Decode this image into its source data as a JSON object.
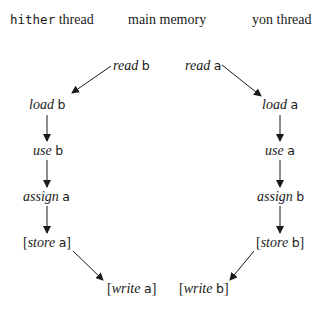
{
  "headers": {
    "hither": {
      "mono": "hither",
      "rest": " thread"
    },
    "main": "main memory",
    "yon": "yon thread"
  },
  "nodes": {
    "read_b": {
      "verb": "read",
      "var": "b",
      "open": "",
      "close": ""
    },
    "read_a": {
      "verb": "read",
      "var": "a",
      "open": "",
      "close": ""
    },
    "load_b": {
      "verb": "load",
      "var": "b",
      "open": "",
      "close": ""
    },
    "load_a": {
      "verb": "load",
      "var": "a",
      "open": "",
      "close": ""
    },
    "use_b": {
      "verb": "use",
      "var": "b",
      "open": "",
      "close": ""
    },
    "use_a": {
      "verb": "use",
      "var": "a",
      "open": "",
      "close": ""
    },
    "assign_a": {
      "verb": "assign",
      "var": "a",
      "open": "",
      "close": ""
    },
    "assign_b": {
      "verb": "assign",
      "var": "b",
      "open": "",
      "close": ""
    },
    "store_a": {
      "verb": "store",
      "var": "a",
      "open": "[",
      "close": "]"
    },
    "store_b": {
      "verb": "store",
      "var": "b",
      "open": "[",
      "close": "]"
    },
    "write_a": {
      "verb": "write",
      "var": "a",
      "open": "[",
      "close": "]"
    },
    "write_b": {
      "verb": "write",
      "var": "b",
      "open": "[",
      "close": "]"
    }
  },
  "edges": [
    {
      "from": "read_b",
      "to": "load_b"
    },
    {
      "from": "load_b",
      "to": "use_b"
    },
    {
      "from": "use_b",
      "to": "assign_a"
    },
    {
      "from": "assign_a",
      "to": "store_a"
    },
    {
      "from": "store_a",
      "to": "write_a"
    },
    {
      "from": "read_a",
      "to": "load_a"
    },
    {
      "from": "load_a",
      "to": "use_a"
    },
    {
      "from": "use_a",
      "to": "assign_b"
    },
    {
      "from": "assign_b",
      "to": "store_b"
    },
    {
      "from": "store_b",
      "to": "write_b"
    }
  ],
  "colors": {
    "ink": "#1a1a1a",
    "background": "#ffffff"
  }
}
